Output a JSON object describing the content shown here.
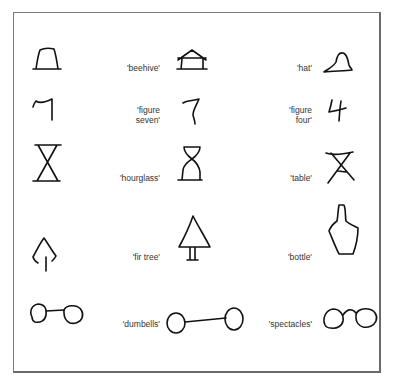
{
  "figure": {
    "rows": [
      {
        "label_a": "'beehive'",
        "label_b": "'hat'"
      },
      {
        "label_a_lines": [
          "'figure",
          "seven'"
        ],
        "label_b_lines": [
          "'figure",
          "four'"
        ]
      },
      {
        "label_a": "'hourglass'",
        "label_b": "'table'"
      },
      {
        "label_a": "'fir tree'",
        "label_b": "'bottle'"
      },
      {
        "label_a": "'dumbells'",
        "label_b": "'spectacles'"
      }
    ]
  }
}
